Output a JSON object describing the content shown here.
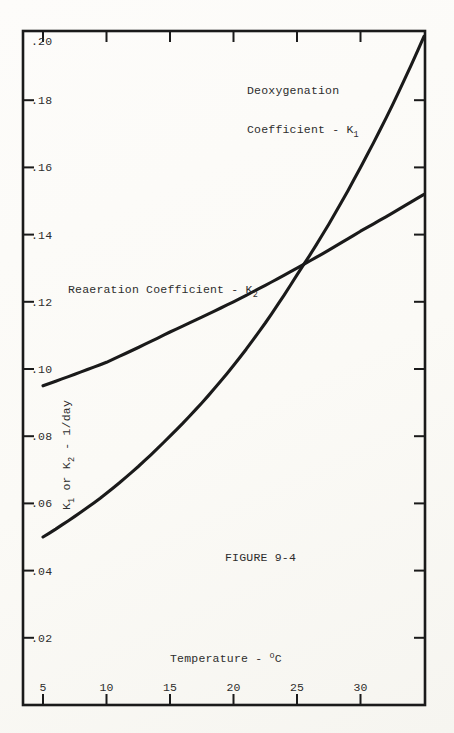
{
  "page": {
    "paper_color": "#fbfaf6",
    "ink_color": "#1a1a1a",
    "text_color": "#2d2d2d"
  },
  "figure": {
    "caption": "FIGURE 9-4",
    "x_axis_title": [
      {
        "t": "Temperature - "
      },
      {
        "sup": "o"
      },
      {
        "t": "C"
      }
    ],
    "y_axis_title": [
      {
        "t": "K"
      },
      {
        "sub": "1"
      },
      {
        "t": " or K"
      },
      {
        "sub": "2"
      },
      {
        "t": " - 1/day"
      }
    ],
    "x_tick_labels": [
      "5",
      "10",
      "15",
      "20",
      "25",
      "30"
    ],
    "x_tick_values": [
      5,
      10,
      15,
      20,
      25,
      30
    ],
    "y_tick_labels": [
      ".20",
      ".18",
      ".16",
      ".14",
      ".12",
      ".10",
      ".08",
      ".06",
      ".04",
      ".02"
    ],
    "y_tick_values": [
      0.2,
      0.18,
      0.16,
      0.14,
      0.12,
      0.1,
      0.08,
      0.06,
      0.04,
      0.02
    ],
    "annotations": {
      "k1_line1": "Deoxygenation",
      "k1_line2": [
        {
          "t": "Coefficient - K"
        },
        {
          "sub": "1"
        }
      ],
      "k2_line": [
        {
          "t": "Reaeration Coefficient - K"
        },
        {
          "sub": "2"
        }
      ]
    }
  },
  "chart_data": {
    "type": "line",
    "title": "FIGURE 9-4",
    "xlabel": "Temperature - °C",
    "ylabel": "K1 or K2 - 1/day",
    "x": [
      5,
      10,
      15,
      20,
      25,
      30,
      35
    ],
    "series": [
      {
        "name": "Deoxygenation Coefficient - K1",
        "values": [
          0.05,
          0.063,
          0.08,
          0.101,
          0.128,
          0.16,
          0.199
        ]
      },
      {
        "name": "Reaeration Coefficient - K2",
        "values": [
          0.095,
          0.102,
          0.111,
          0.12,
          0.13,
          0.141,
          0.152
        ]
      }
    ],
    "xlim": [
      3.4,
      35.2
    ],
    "ylim": [
      0,
      0.201
    ],
    "grid": false,
    "legend_position": "inline-annotations"
  }
}
